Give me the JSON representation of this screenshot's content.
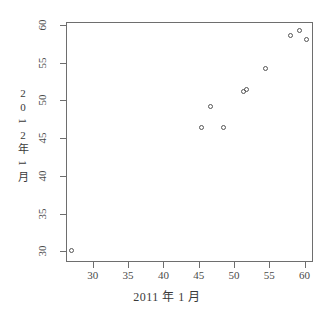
{
  "chart_data": {
    "type": "scatter",
    "title": "",
    "xlabel": "2011 年 1 月",
    "ylabel_chars": [
      "2",
      "0",
      "1",
      "2",
      "年",
      "1",
      "月"
    ],
    "ylabel": "2012 年 1 月",
    "xlim": [
      26.2,
      61.2
    ],
    "ylim": [
      28.6,
      60.4
    ],
    "xticks": [
      30,
      35,
      40,
      45,
      50,
      55,
      60
    ],
    "yticks": [
      30,
      35,
      40,
      45,
      50,
      55,
      60
    ],
    "xtick_labels": [
      "30",
      "35",
      "40",
      "45",
      "50",
      "55",
      "60"
    ],
    "ytick_labels": [
      "30",
      "35",
      "40",
      "45",
      "50",
      "55",
      "60"
    ],
    "grid": false,
    "legend": "none",
    "point_symbol": "open-circle",
    "point_color": "#555555",
    "frame_color": "#6e6e6e",
    "points": [
      {
        "x": 26.9,
        "y": 30.2
      },
      {
        "x": 45.2,
        "y": 46.6
      },
      {
        "x": 46.5,
        "y": 49.3
      },
      {
        "x": 48.4,
        "y": 46.6
      },
      {
        "x": 51.2,
        "y": 51.3
      },
      {
        "x": 51.7,
        "y": 51.6
      },
      {
        "x": 54.3,
        "y": 54.4
      },
      {
        "x": 57.8,
        "y": 58.8
      },
      {
        "x": 59.1,
        "y": 59.4
      },
      {
        "x": 60.1,
        "y": 58.2
      }
    ]
  }
}
